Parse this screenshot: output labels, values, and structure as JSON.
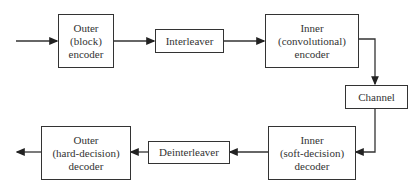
{
  "diagram": {
    "blocks": [
      {
        "id": "outer-encoder",
        "lines": [
          "Outer",
          "(block)",
          "encoder"
        ]
      },
      {
        "id": "interleaver",
        "lines": [
          "Interleaver"
        ]
      },
      {
        "id": "inner-encoder",
        "lines": [
          "Inner",
          "(convolutional)",
          "encoder"
        ]
      },
      {
        "id": "channel",
        "lines": [
          "Channel"
        ]
      },
      {
        "id": "inner-decoder",
        "lines": [
          "Inner",
          "(soft-decision)",
          "decoder"
        ]
      },
      {
        "id": "deinterleaver",
        "lines": [
          "Deinterleaver"
        ]
      },
      {
        "id": "outer-decoder",
        "lines": [
          "Outer",
          "(hard-decision)",
          "decoder"
        ]
      }
    ],
    "edges": [
      [
        "input",
        "outer-encoder"
      ],
      [
        "outer-encoder",
        "interleaver"
      ],
      [
        "interleaver",
        "inner-encoder"
      ],
      [
        "inner-encoder",
        "channel"
      ],
      [
        "channel",
        "inner-decoder"
      ],
      [
        "inner-decoder",
        "deinterleaver"
      ],
      [
        "deinterleaver",
        "outer-decoder"
      ],
      [
        "outer-decoder",
        "output"
      ]
    ]
  }
}
